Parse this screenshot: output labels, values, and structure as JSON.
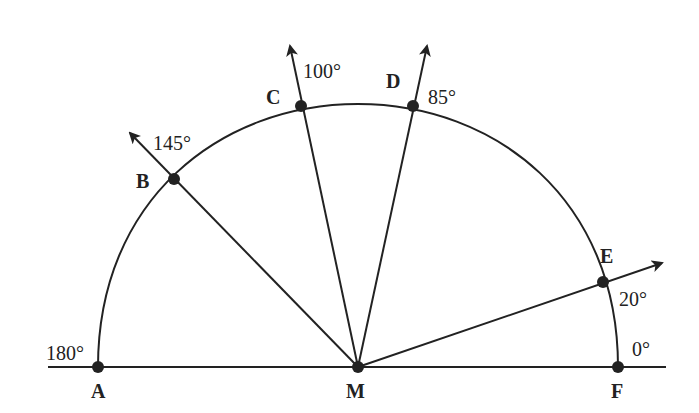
{
  "diagram": {
    "center": {
      "label": "M"
    },
    "baseline_points": [
      {
        "label": "A",
        "angle_label": "180°",
        "angle": 180
      },
      {
        "label": "F",
        "angle_label": "0°",
        "angle": 0
      }
    ],
    "rays": [
      {
        "label": "B",
        "angle_label": "145°",
        "angle": 145
      },
      {
        "label": "C",
        "angle_label": "100°",
        "angle": 100
      },
      {
        "label": "D",
        "angle_label": "85°",
        "angle": 85
      },
      {
        "label": "E",
        "angle_label": "20°",
        "angle": 20
      }
    ],
    "colors": {
      "stroke": "#222222",
      "background": "#ffffff"
    }
  }
}
